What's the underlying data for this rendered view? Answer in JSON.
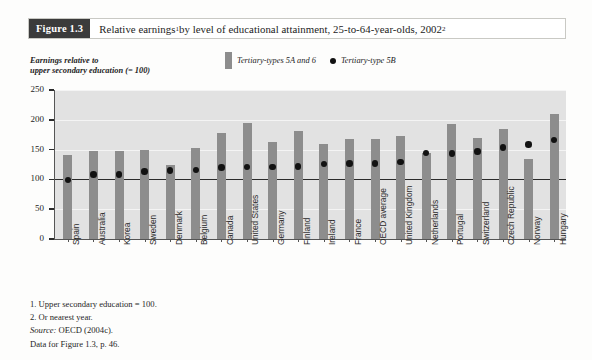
{
  "figure": {
    "tag": "Figure 1.3",
    "title_prefix": "Relative earnings",
    "title_sup1": "1",
    "title_mid": " by level of educational attainment, 25-to-64-year-olds, 2002",
    "title_sup2": "2",
    "title_full": "Relative earnings1 by level of educational attainment, 25-to-64-year-olds, 20022"
  },
  "axis_caption": {
    "line1": "Earnings relative to",
    "line2": "upper secondary education (= 100)"
  },
  "legend": {
    "bar_label": "Tertiary-types 5A and 6",
    "dot_label": "Tertiary-type 5B",
    "bar_color": "#8d8d8d",
    "dot_color": "#121212"
  },
  "notes": {
    "note1": "1. Upper secondary education = 100.",
    "note2": "2. Or nearest year.",
    "source_label": "Source:",
    "source_text": " OECD (2004c).",
    "data_ref": "Data for Figure 1.3, p. 46."
  },
  "chart_data": {
    "type": "bar",
    "xlabel": "",
    "ylabel": "Earnings relative to upper secondary education (= 100)",
    "ylim": [
      0,
      250
    ],
    "yticks": [
      0,
      50,
      100,
      150,
      200,
      250
    ],
    "grid": true,
    "reference_line": 100,
    "legend_position": "top-center",
    "categories": [
      "Spain",
      "Australia",
      "Korea",
      "Sweden",
      "Denmark",
      "Belgium",
      "Canada",
      "United States",
      "Germany",
      "Finland",
      "Ireland",
      "France",
      "OECD average",
      "United Kingdom",
      "Netherlands",
      "Portugal",
      "Switzerland",
      "Czech Republic",
      "Norway",
      "Hungary"
    ],
    "series": [
      {
        "name": "Tertiary-types 5A and 6",
        "kind": "bar",
        "color": "#8d8d8d",
        "values": [
          141,
          147,
          147,
          149,
          125,
          152,
          178,
          195,
          163,
          182,
          160,
          167,
          167,
          172,
          145,
          193,
          170,
          184,
          135,
          210
        ]
      },
      {
        "name": "Tertiary-type 5B",
        "kind": "scatter",
        "color": "#121212",
        "values": [
          99,
          108,
          108,
          113,
          115,
          116,
          120,
          121,
          121,
          122,
          126,
          127,
          127,
          129,
          144,
          143,
          147,
          154,
          159,
          166
        ]
      }
    ]
  }
}
